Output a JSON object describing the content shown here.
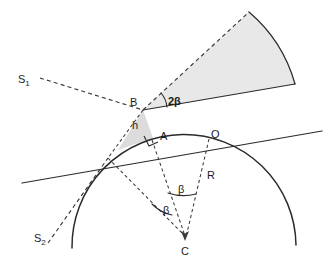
{
  "figure": {
    "type": "geometric-diagram",
    "background_color": "#ffffff",
    "line_color": "#2b2b2b",
    "wedge_fill_color": "#e8e8e8",
    "triangle_fill_color": "#dcdcdc"
  },
  "labels": {
    "s1": "S",
    "s1_sub": "1",
    "s2": "S",
    "s2_sub": "2",
    "point_b": "B",
    "point_a": "A",
    "point_o": "O",
    "point_c": "C",
    "height_h": "h",
    "radius_r": "R",
    "angle_two_beta": "2β",
    "angle_beta_upper": "β",
    "angle_beta_lower": "β"
  },
  "geometry": {
    "center_c": [
      185,
      238
    ],
    "point_b": [
      143,
      110
    ],
    "point_a": [
      153,
      138
    ],
    "point_o": [
      210,
      136
    ],
    "circle_radius": 106,
    "wedge_apex": [
      143,
      110
    ],
    "wedge_angle_label": "2β",
    "central_angles": [
      "β",
      "β"
    ]
  }
}
